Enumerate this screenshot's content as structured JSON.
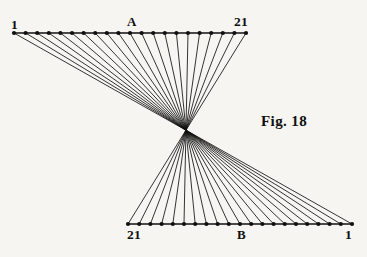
{
  "figure": {
    "caption": "Fig. 18",
    "background_color": "#f6f5f2",
    "ink_color": "#111010",
    "width": 367,
    "height": 257
  },
  "labels": {
    "top_left": "1",
    "top_mid": "A",
    "top_right": "21",
    "bottom_left": "21",
    "bottom_mid": "B",
    "bottom_right": "1"
  },
  "chart_data": {
    "type": "line",
    "title": "Fig. 18",
    "xlabel": "",
    "ylabel": "",
    "grid": false,
    "legend": null,
    "xlim": [
      0,
      367
    ],
    "ylim": [
      0,
      257
    ],
    "point_count_per_row": 21,
    "rows": [
      {
        "name": "A",
        "label_left": "1",
        "label_right": "21",
        "label_mid": "A",
        "y": 33,
        "x_start": 14,
        "x_end": 246,
        "numbering_direction": "left-to-right",
        "marker": "filled-dot",
        "marker_radius": 2.1
      },
      {
        "name": "B",
        "label_left": "21",
        "label_right": "1",
        "label_mid": "B",
        "y": 224,
        "x_start": 128,
        "x_end": 352,
        "numbering_direction": "right-to-left",
        "marker": "filled-dot",
        "marker_radius": 2.1
      }
    ],
    "connection_rule": "point i on row A joins point i on row B (A numbered left-to-right, B numbered right-to-left)",
    "series": [
      {
        "name": "line-1",
        "x": [
          14.0,
          352.0
        ],
        "y": [
          33,
          224
        ]
      },
      {
        "name": "line-2",
        "x": [
          25.6,
          340.8
        ],
        "y": [
          33,
          224
        ]
      },
      {
        "name": "line-3",
        "x": [
          37.2,
          329.6
        ],
        "y": [
          33,
          224
        ]
      },
      {
        "name": "line-4",
        "x": [
          48.8,
          318.4
        ],
        "y": [
          33,
          224
        ]
      },
      {
        "name": "line-5",
        "x": [
          60.4,
          307.2
        ],
        "y": [
          33,
          224
        ]
      },
      {
        "name": "line-6",
        "x": [
          72.0,
          296.0
        ],
        "y": [
          33,
          224
        ]
      },
      {
        "name": "line-7",
        "x": [
          83.6,
          284.8
        ],
        "y": [
          33,
          224
        ]
      },
      {
        "name": "line-8",
        "x": [
          95.2,
          273.6
        ],
        "y": [
          33,
          224
        ]
      },
      {
        "name": "line-9",
        "x": [
          106.8,
          262.4
        ],
        "y": [
          33,
          224
        ]
      },
      {
        "name": "line-10",
        "x": [
          118.4,
          251.2
        ],
        "y": [
          33,
          224
        ]
      },
      {
        "name": "line-11",
        "x": [
          130.0,
          240.0
        ],
        "y": [
          33,
          224
        ]
      },
      {
        "name": "line-12",
        "x": [
          141.6,
          228.8
        ],
        "y": [
          33,
          224
        ]
      },
      {
        "name": "line-13",
        "x": [
          153.2,
          217.6
        ],
        "y": [
          33,
          224
        ]
      },
      {
        "name": "line-14",
        "x": [
          164.8,
          206.4
        ],
        "y": [
          33,
          224
        ]
      },
      {
        "name": "line-15",
        "x": [
          176.4,
          195.2
        ],
        "y": [
          33,
          224
        ]
      },
      {
        "name": "line-16",
        "x": [
          188.0,
          184.0
        ],
        "y": [
          33,
          224
        ]
      },
      {
        "name": "line-17",
        "x": [
          199.6,
          172.8
        ],
        "y": [
          33,
          224
        ]
      },
      {
        "name": "line-18",
        "x": [
          211.2,
          161.6
        ],
        "y": [
          33,
          224
        ]
      },
      {
        "name": "line-19",
        "x": [
          222.8,
          150.4
        ],
        "y": [
          33,
          224
        ]
      },
      {
        "name": "line-20",
        "x": [
          234.4,
          139.2
        ],
        "y": [
          33,
          224
        ]
      },
      {
        "name": "line-21",
        "x": [
          246.0,
          128.0
        ],
        "y": [
          33,
          224
        ]
      }
    ]
  }
}
